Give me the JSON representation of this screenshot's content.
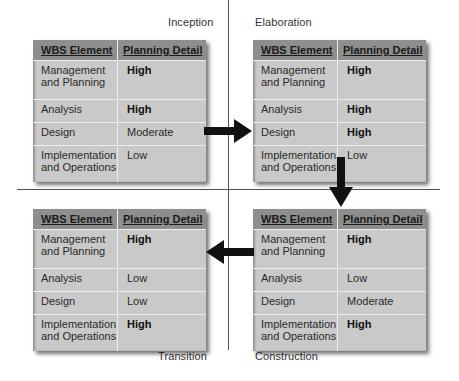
{
  "phases": {
    "inception": "Inception",
    "elaboration": "Elaboration",
    "construction": "Construction",
    "transition": "Transition"
  },
  "headers": {
    "element": "WBS Element",
    "detail": "Planning Detail"
  },
  "tables": {
    "inception": {
      "rows": [
        {
          "element": "Management and Planning",
          "detail": "High",
          "bold": true
        },
        {
          "element": "Analysis",
          "detail": "High",
          "bold": true
        },
        {
          "element": "Design",
          "detail": "Moderate",
          "bold": false
        },
        {
          "element": "Implementation and Operations",
          "detail": "Low",
          "bold": false
        }
      ]
    },
    "elaboration": {
      "rows": [
        {
          "element": "Management and Planning",
          "detail": "High",
          "bold": true
        },
        {
          "element": "Analysis",
          "detail": "High",
          "bold": true
        },
        {
          "element": "Design",
          "detail": "High",
          "bold": true
        },
        {
          "element": "Implementation and Operations",
          "detail": "Low",
          "bold": false
        }
      ]
    },
    "construction": {
      "rows": [
        {
          "element": "Management and Planning",
          "detail": "High",
          "bold": true
        },
        {
          "element": "Analysis",
          "detail": "Low",
          "bold": false
        },
        {
          "element": "Design",
          "detail": "Moderate",
          "bold": false
        },
        {
          "element": "Implementation and Operations",
          "detail": "High",
          "bold": true
        }
      ]
    },
    "transition": {
      "rows": [
        {
          "element": "Management and Planning",
          "detail": "High",
          "bold": true
        },
        {
          "element": "Analysis",
          "detail": "Low",
          "bold": false
        },
        {
          "element": "Design",
          "detail": "Low",
          "bold": false
        },
        {
          "element": "Implementation and Operations",
          "detail": "High",
          "bold": true
        }
      ]
    }
  },
  "flow": [
    "Inception",
    "Elaboration",
    "Construction",
    "Transition"
  ],
  "colors": {
    "table_body": "#c9c9c9",
    "table_header": "#8e8e8e",
    "arrow": "#111111"
  }
}
